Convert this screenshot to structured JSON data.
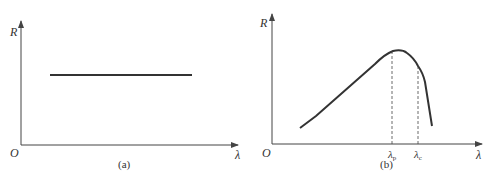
{
  "panels": [
    {
      "id": "a",
      "caption": "(a)",
      "y_axis_label": "R",
      "x_axis_label": "λ",
      "origin_label": "O",
      "curve": "constant horizontal line"
    },
    {
      "id": "b",
      "caption": "(b)",
      "y_axis_label": "R",
      "x_axis_label": "λ",
      "origin_label": "O",
      "curve": "rises linearly to peak at λp, then falls steeply after λc",
      "markers": [
        {
          "label": "λ",
          "subscript": "p"
        },
        {
          "label": "λ",
          "subscript": "c"
        }
      ]
    }
  ],
  "colors": {
    "line": "#333333",
    "axis": "#444444"
  }
}
